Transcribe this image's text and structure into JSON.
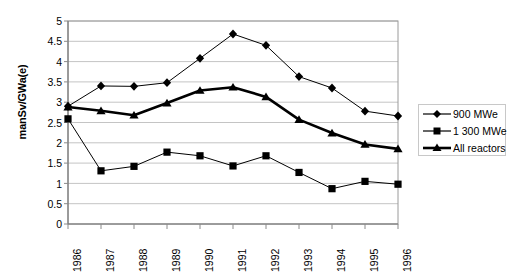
{
  "chart_data": {
    "type": "line",
    "title": "",
    "subtitle": "",
    "xlabel": "",
    "ylabel": "manSv/GWa(e)",
    "categories": [
      "1986",
      "1987",
      "1988",
      "1989",
      "1990",
      "1991",
      "1992",
      "1993",
      "1994",
      "1995",
      "1996"
    ],
    "x": [
      1986,
      1987,
      1988,
      1989,
      1990,
      1991,
      1992,
      1993,
      1994,
      1995,
      1996
    ],
    "ylim": [
      0,
      5
    ],
    "yticks": [
      0,
      0.5,
      1,
      1.5,
      2,
      2.5,
      3,
      3.5,
      4,
      4.5,
      5
    ],
    "ytick_labels": [
      "0",
      "0.5",
      "1",
      "1.5",
      "2",
      "2.5",
      "3",
      "3.5",
      "4",
      "4.5",
      "5"
    ],
    "grid": "horizontal",
    "legend_position": "right",
    "series": [
      {
        "name": "900 MWe",
        "marker": "diamond",
        "color": "#000000",
        "line_width": 1,
        "values": [
          2.9,
          3.4,
          3.39,
          3.48,
          4.08,
          4.68,
          4.4,
          3.63,
          3.35,
          2.78,
          2.66
        ]
      },
      {
        "name": "1 300 MWe",
        "marker": "square",
        "color": "#000000",
        "line_width": 1,
        "values": [
          2.59,
          1.31,
          1.42,
          1.77,
          1.68,
          1.43,
          1.68,
          1.27,
          0.87,
          1.05,
          0.98
        ]
      },
      {
        "name": "All reactors",
        "marker": "triangle",
        "color": "#000000",
        "line_width": 2.6,
        "values": [
          2.88,
          2.79,
          2.68,
          2.98,
          3.29,
          3.37,
          3.13,
          2.57,
          2.24,
          1.96,
          1.85
        ]
      }
    ]
  },
  "axes": {
    "y_title": "manSv/GWa(e)",
    "y_tick_labels": [
      "5",
      "4.5",
      "4",
      "3.5",
      "3",
      "2.5",
      "2",
      "1.5",
      "1",
      "0.5",
      "0"
    ],
    "x_tick_labels": [
      "1986",
      "1987",
      "1988",
      "1989",
      "1990",
      "1991",
      "1992",
      "1993",
      "1994",
      "1995",
      "1996"
    ]
  },
  "legend": {
    "entries": [
      {
        "label": "900 MWe",
        "marker": "diamond-marker-icon"
      },
      {
        "label": "1 300 MWe",
        "marker": "square-marker-icon"
      },
      {
        "label": "All reactors",
        "marker": "triangle-marker-icon"
      }
    ]
  },
  "colors": {
    "plot_border": "#9a9a9a",
    "gridline": "#c4c4c4",
    "series": "#000000",
    "legend_border": "#c8c8c8",
    "background": "#ffffff"
  }
}
